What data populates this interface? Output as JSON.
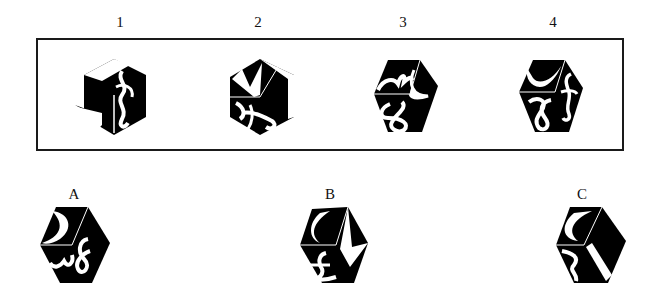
{
  "question": {
    "instruction_visible": false,
    "given_views_frame": true,
    "given_views": [
      {
        "label": "1",
        "faces": {
          "top": "chevron-shapes",
          "left": "star-arrow",
          "right": "ampersand-f"
        }
      },
      {
        "label": "2",
        "faces": {
          "top": "m-chevron",
          "left": "pound-sign-rotated",
          "right": "diamond-stripes"
        }
      },
      {
        "label": "3",
        "faces": {
          "top": "crown-arc",
          "left": "ampersand",
          "right": "crescent"
        }
      },
      {
        "label": "4",
        "faces": {
          "top": "crescent",
          "left": "ampersand",
          "right": "f-script"
        }
      }
    ],
    "options": [
      {
        "label": "A",
        "faces": {
          "top": "crescent",
          "left": "crown-arc",
          "right": "ampersand"
        }
      },
      {
        "label": "B",
        "faces": {
          "top": "crescent",
          "left": "pound-sign",
          "right": "star-arrow"
        }
      },
      {
        "label": "C",
        "faces": {
          "top": "crescent",
          "left": "crown-arc",
          "right": "diamond-stripes"
        }
      }
    ]
  },
  "colors": {
    "ink": "#000000",
    "paper": "#ffffff",
    "frame": "#1a1a1a"
  }
}
